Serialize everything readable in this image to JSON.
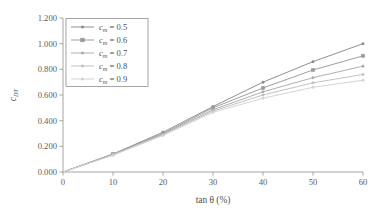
{
  "chart_data": {
    "type": "line",
    "title": "",
    "xlabel": "tan θ (%)",
    "ylabel": "c_DT",
    "ylabel_main": "c",
    "ylabel_sub": "DT",
    "xlim": [
      0,
      60
    ],
    "ylim": [
      0.0,
      1.2
    ],
    "grid": false,
    "legend_position": "upper-left",
    "x": [
      0,
      10,
      20,
      30,
      40,
      50,
      60
    ],
    "xticks": [
      "0",
      "10",
      "20",
      "30",
      "40",
      "50",
      "60"
    ],
    "yticks": [
      "0.000",
      "0.200",
      "0.400",
      "0.600",
      "0.800",
      "1.000",
      "1.200"
    ],
    "ytick_values": [
      0.0,
      0.2,
      0.4,
      0.6,
      0.8,
      1.0,
      1.2
    ],
    "legend_var": "c",
    "legend_var_sub": "m",
    "series": [
      {
        "name": "c_m = 0.5",
        "label_value": "0.5",
        "color": "#8a8a8a",
        "marker": "dot",
        "values": [
          0.0,
          0.14,
          0.31,
          0.51,
          0.7,
          0.86,
          1.0
        ]
      },
      {
        "name": "c_m = 0.6",
        "label_value": "0.6",
        "color": "#9a9a9a",
        "marker": "square",
        "values": [
          0.0,
          0.14,
          0.3,
          0.5,
          0.655,
          0.795,
          0.905
        ]
      },
      {
        "name": "c_m = 0.7",
        "label_value": "0.7",
        "color": "#ababab",
        "marker": "dot",
        "values": [
          0.0,
          0.135,
          0.295,
          0.485,
          0.625,
          0.735,
          0.825
        ]
      },
      {
        "name": "c_m = 0.8",
        "label_value": "0.8",
        "color": "#c0c0c0",
        "marker": "dot",
        "values": [
          0.0,
          0.135,
          0.29,
          0.475,
          0.6,
          0.695,
          0.76
        ]
      },
      {
        "name": "c_m = 0.9",
        "label_value": "0.9",
        "color": "#d2d2d2",
        "marker": "dot",
        "values": [
          0.0,
          0.13,
          0.285,
          0.465,
          0.575,
          0.66,
          0.715
        ]
      }
    ]
  },
  "axis": {
    "line_color": "#9b9b9b",
    "equals": "="
  }
}
